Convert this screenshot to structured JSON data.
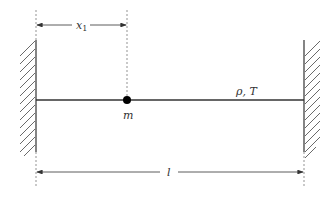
{
  "diagram": {
    "type": "string-with-point-mass",
    "labels": {
      "position": "x",
      "position_subscript": "1",
      "mass": "m",
      "string_props": "ρ, T",
      "length": "l"
    },
    "colors": {
      "line": "#333333",
      "mass": "#000000",
      "dashed": "#666666",
      "hatch": "#444444"
    }
  }
}
